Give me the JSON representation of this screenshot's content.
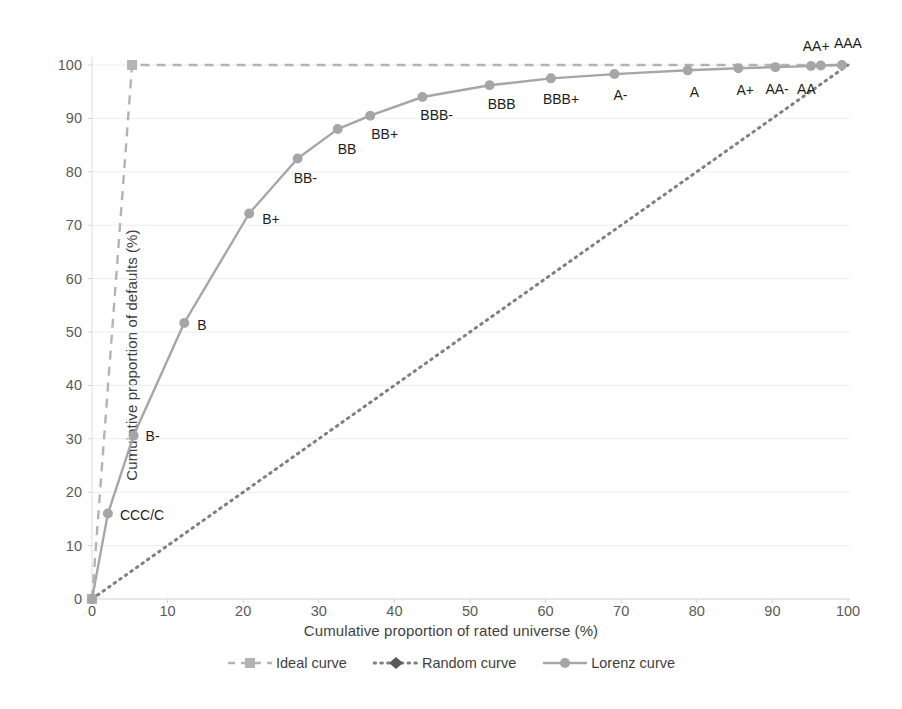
{
  "chart_data": {
    "type": "line",
    "title": "",
    "xlabel": "Cumulative proportion of rated universe (%)",
    "ylabel": "Cumulative proportion of defaults (%)",
    "xlim": [
      0,
      100
    ],
    "ylim": [
      0,
      100
    ],
    "xticks": [
      0,
      10,
      20,
      30,
      40,
      50,
      60,
      70,
      80,
      90,
      100
    ],
    "yticks": [
      0,
      10,
      20,
      30,
      40,
      50,
      60,
      70,
      80,
      90,
      100
    ],
    "grid": "horizontal-faint",
    "legend_position": "bottom-center",
    "series": [
      {
        "name": "Ideal curve",
        "style": "dashed",
        "marker": "square",
        "color": "#b3b3b3",
        "x": [
          0,
          5.3,
          100
        ],
        "y": [
          0,
          100,
          100
        ]
      },
      {
        "name": "Random curve",
        "style": "dotted",
        "marker": "diamond",
        "color": "#808080",
        "x": [
          0,
          100
        ],
        "y": [
          0,
          100
        ]
      },
      {
        "name": "Lorenz curve",
        "style": "solid",
        "marker": "circle",
        "color": "#a6a6a6",
        "x": [
          0,
          2.1,
          5.5,
          12.2,
          20.8,
          27.2,
          32.5,
          36.8,
          43.7,
          52.6,
          60.7,
          69.1,
          78.8,
          85.5,
          90.4,
          95.1,
          96.4,
          99.2
        ],
        "y": [
          0,
          16.0,
          30.6,
          51.7,
          72.2,
          82.5,
          88.0,
          90.5,
          94.0,
          96.2,
          97.5,
          98.3,
          99.0,
          99.4,
          99.6,
          99.8,
          99.9,
          100.0
        ],
        "point_labels": [
          "",
          "CCC/C",
          "B-",
          "B",
          "B+",
          "BB-",
          "BB",
          "BB+",
          "BBB-",
          "BBB",
          "BBB+",
          "A-",
          "A",
          "A+",
          "AA-",
          "AA",
          "AA+",
          "AAA"
        ]
      }
    ]
  },
  "legend": {
    "items": [
      {
        "label": "Ideal curve",
        "marker": "square-marker-icon",
        "line": "dashed-line-icon",
        "color": "#b3b3b3"
      },
      {
        "label": "Random curve",
        "marker": "diamond-marker-icon",
        "line": "dotted-line-icon",
        "color": "#808080"
      },
      {
        "label": "Lorenz curve",
        "marker": "circle-marker-icon",
        "line": "solid-line-icon",
        "color": "#a6a6a6"
      }
    ]
  },
  "axes": {
    "x_title": "Cumulative proportion of rated universe (%)",
    "y_title": "Cumulative proportion of defaults (%)"
  },
  "point_label_offsets": {
    "CCC/C": {
      "dx": 12,
      "dy": 1
    },
    "B-": {
      "dx": 12,
      "dy": 0
    },
    "B": {
      "dx": 13,
      "dy": 2
    },
    "B+": {
      "dx": 13,
      "dy": 6
    },
    "BB-": {
      "dx": -4,
      "dy": 20
    },
    "BB": {
      "dx": 0,
      "dy": 20
    },
    "BB+": {
      "dx": 1,
      "dy": 18
    },
    "BBB-": {
      "dx": -2,
      "dy": 18
    },
    "BBB": {
      "dx": -2,
      "dy": 19
    },
    "BBB+": {
      "dx": -8,
      "dy": 21
    },
    "A-": {
      "dx": -1,
      "dy": 21
    },
    "A": {
      "dx": 2,
      "dy": 22
    },
    "A+": {
      "dx": -2,
      "dy": 22
    },
    "AA-": {
      "dx": -10,
      "dy": 22
    },
    "AA": {
      "dx": -14,
      "dy": 23
    },
    "AA+": {
      "dx": -18,
      "dy": -20
    },
    "AAA": {
      "dx": -8,
      "dy": -22
    }
  }
}
